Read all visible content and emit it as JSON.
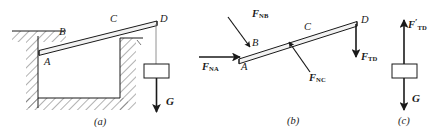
{
  "figure": {
    "type": "statics-free-body-diagram",
    "background_color": "#ffffff",
    "line_color": "#1a1a1a",
    "hatch_color": "#555555"
  },
  "panels": [
    {
      "id": "a",
      "caption": "(a)",
      "description": "Beam AD resting in a trench with a weight G suspended from end D",
      "point_labels": [
        "A",
        "B",
        "C",
        "D"
      ],
      "force_labels": [
        "G"
      ]
    },
    {
      "id": "b",
      "caption": "(b)",
      "description": "Free-body diagram of beam AD showing contact normal forces and cord tension",
      "point_labels": [
        "A",
        "B",
        "C",
        "D"
      ],
      "force_labels": [
        "F_NA",
        "F_NB",
        "F_NC",
        "F_TD"
      ]
    },
    {
      "id": "c",
      "caption": "(c)",
      "description": "Free-body diagram of the suspended block",
      "point_labels": [],
      "force_labels": [
        "F'_TD",
        "G"
      ]
    }
  ],
  "labels": {
    "panel_a": {
      "point_a": "A",
      "point_b": "B",
      "point_c": "C",
      "point_d": "D",
      "weight": "G",
      "caption": "(a)"
    },
    "panel_b": {
      "point_a": "A",
      "point_b": "B",
      "point_c": "C",
      "point_d": "D",
      "f_na_base": "F",
      "f_na_sub": "NA",
      "f_nb_base": "F",
      "f_nb_sub": "NB",
      "f_nc_base": "F",
      "f_nc_sub": "NC",
      "f_td_base": "F",
      "f_td_sub": "TD",
      "caption": "(b)"
    },
    "panel_c": {
      "f_td_base": "F",
      "f_td_prime": "′",
      "f_td_sub": "TD",
      "weight": "G",
      "caption": "(c)"
    }
  }
}
